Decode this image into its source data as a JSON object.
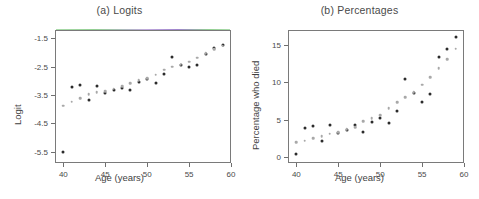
{
  "figure": {
    "background": "#ffffff",
    "obs_color": "#2b2b2b",
    "fit_color": "#a8a8a8"
  },
  "chart_data": [
    {
      "type": "scatter",
      "title": "(a) Logits",
      "xlabel": "Age (years)",
      "ylabel": "Logit",
      "xlim": [
        39.0,
        60.0
      ],
      "ylim": [
        -5.9,
        -1.2
      ],
      "xticks": [
        40,
        45,
        50,
        55,
        60
      ],
      "yticks": [
        -1.5,
        -2.5,
        -3.5,
        -4.5,
        -5.5
      ],
      "xticklabels": [
        "40",
        "45",
        "50",
        "55",
        "60"
      ],
      "yticklabels": [
        "-1.5",
        "-2.5",
        "-3.5",
        "-4.5",
        "-5.5"
      ],
      "grid": false,
      "legend": "none",
      "x": [
        40,
        41,
        42,
        43,
        44,
        45,
        46,
        47,
        48,
        49,
        50,
        51,
        52,
        53,
        54,
        55,
        56,
        57,
        58,
        59
      ],
      "series": [
        {
          "name": "Observed",
          "marker": "filled-circle",
          "color": "#2b2b2b",
          "values": [
            -5.52,
            -3.22,
            -3.13,
            -3.67,
            -3.18,
            -3.42,
            -3.32,
            -3.25,
            -3.33,
            -3.02,
            -2.92,
            -3.07,
            -2.75,
            -2.15,
            -2.43,
            -2.52,
            -2.42,
            -2.05,
            -1.85,
            -1.72
          ]
        },
        {
          "name": "Fitted",
          "marker": "open-circle",
          "color": "#a8a8a8",
          "values": [
            -3.88,
            -3.74,
            -3.6,
            -3.46,
            -3.4,
            -3.37,
            -3.28,
            -3.18,
            -3.08,
            -2.98,
            -2.9,
            -2.78,
            -2.6,
            -2.5,
            -2.42,
            -2.32,
            -2.18,
            -2.02,
            -1.88,
            -1.76
          ]
        }
      ]
    },
    {
      "type": "scatter",
      "title": "(b) Percentages",
      "xlabel": "Age (years)",
      "ylabel": "Percentage who died",
      "xlim": [
        39.0,
        60.0
      ],
      "ylim": [
        -0.8,
        17.0
      ],
      "xticks": [
        40,
        45,
        50,
        55,
        60
      ],
      "yticks": [
        0,
        5,
        10,
        15
      ],
      "xticklabels": [
        "40",
        "45",
        "50",
        "55",
        "60"
      ],
      "yticklabels": [
        "0",
        "5",
        "10",
        "15"
      ],
      "grid": false,
      "legend": "none",
      "x": [
        40,
        41,
        42,
        43,
        44,
        45,
        46,
        47,
        48,
        49,
        50,
        51,
        52,
        53,
        54,
        55,
        56,
        57,
        58,
        59
      ],
      "series": [
        {
          "name": "Observed",
          "marker": "filled-circle",
          "color": "#2b2b2b",
          "values": [
            0.4,
            3.9,
            4.2,
            2.2,
            4.3,
            3.2,
            3.6,
            4.3,
            3.4,
            4.7,
            5.2,
            4.6,
            6.1,
            10.4,
            8.6,
            7.4,
            8.5,
            13.4,
            14.5,
            16.0
          ]
        },
        {
          "name": "Fitted",
          "marker": "open-circle",
          "color": "#a8a8a8",
          "values": [
            2.0,
            2.2,
            2.5,
            2.8,
            3.1,
            3.3,
            3.7,
            4.0,
            4.8,
            5.2,
            5.6,
            6.5,
            7.3,
            8.0,
            8.7,
            9.7,
            10.7,
            11.9,
            13.1,
            14.5
          ]
        }
      ]
    }
  ]
}
